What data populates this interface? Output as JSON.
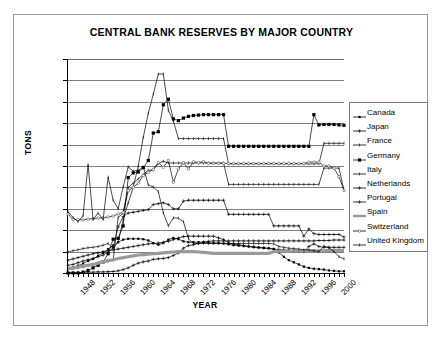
{
  "chart_data": {
    "type": "line",
    "title": "CENTRAL BANK RESERVES BY MAJOR COUNTRY",
    "xlabel": "YEAR",
    "ylabel": "TONS",
    "ylim": [
      0,
      5000
    ],
    "xlim": [
      1948,
      2003
    ],
    "grid": true,
    "legend_position": "right",
    "ytick_labels": [
      "5000",
      "4500",
      "4000",
      "3500",
      "3000",
      "2500",
      "2000",
      "1500",
      "1000",
      "500",
      "0"
    ],
    "ytick_values": [
      5000,
      4500,
      4000,
      3500,
      3000,
      2500,
      2000,
      1500,
      1000,
      500,
      0
    ],
    "xtick_labels": [
      "1948",
      "1952",
      "1956",
      "1960",
      "1964",
      "1968",
      "1972",
      "1976",
      "1980",
      "1984",
      "1988",
      "1992",
      "1996",
      "2000"
    ],
    "xtick_values": [
      1948,
      1952,
      1956,
      1960,
      1964,
      1968,
      1972,
      1976,
      1980,
      1984,
      1988,
      1992,
      1996,
      2000
    ],
    "x": [
      1948,
      1949,
      1950,
      1951,
      1952,
      1953,
      1954,
      1955,
      1956,
      1957,
      1958,
      1959,
      1960,
      1961,
      1962,
      1963,
      1964,
      1965,
      1966,
      1967,
      1968,
      1969,
      1970,
      1971,
      1972,
      1973,
      1974,
      1975,
      1976,
      1977,
      1978,
      1979,
      1980,
      1981,
      1982,
      1983,
      1984,
      1985,
      1986,
      1987,
      1988,
      1989,
      1990,
      1991,
      1992,
      1993,
      1994,
      1995,
      1996,
      1997,
      1998,
      1999,
      2000,
      2001,
      2002,
      2003
    ],
    "series": [
      {
        "name": "Canada",
        "marker": "small-square",
        "values": [
          100,
          130,
          170,
          220,
          280,
          330,
          400,
          470,
          560,
          640,
          720,
          780,
          800,
          800,
          800,
          790,
          760,
          700,
          660,
          700,
          780,
          820,
          790,
          740,
          720,
          720,
          720,
          720,
          710,
          700,
          700,
          690,
          670,
          650,
          640,
          630,
          620,
          610,
          600,
          590,
          580,
          560,
          480,
          380,
          300,
          250,
          200,
          150,
          120,
          100,
          90,
          80,
          60,
          50,
          40,
          40
        ]
      },
      {
        "name": "Japan",
        "marker": "plus",
        "values": [
          5,
          10,
          10,
          15,
          20,
          20,
          25,
          25,
          30,
          35,
          50,
          80,
          120,
          180,
          230,
          260,
          280,
          320,
          330,
          340,
          360,
          410,
          470,
          580,
          640,
          660,
          690,
          720,
          740,
          750,
          750,
          750,
          750,
          750,
          750,
          750,
          750,
          750,
          750,
          750,
          750,
          750,
          750,
          750,
          750,
          750,
          750,
          750,
          750,
          750,
          760,
          760,
          760,
          770,
          770,
          770
        ]
      },
      {
        "name": "France",
        "marker": "tick",
        "values": [
          490,
          520,
          540,
          570,
          590,
          600,
          620,
          650,
          690,
          580,
          720,
          1250,
          1640,
          2000,
          2500,
          3170,
          3730,
          4180,
          4650,
          4650,
          3800,
          3550,
          3140,
          3140,
          3140,
          3140,
          3140,
          3140,
          3140,
          3140,
          3140,
          3140,
          2550,
          2550,
          2550,
          2550,
          2550,
          2550,
          2550,
          2550,
          2550,
          2550,
          2550,
          2550,
          2550,
          2550,
          2550,
          2550,
          2550,
          2550,
          2550,
          3030,
          3030,
          3030,
          3030,
          3030
        ]
      },
      {
        "name": "Germany",
        "marker": "filled-square",
        "values": [
          0,
          0,
          0,
          20,
          60,
          120,
          180,
          260,
          450,
          790,
          810,
          1100,
          2230,
          2340,
          2360,
          2460,
          2630,
          3270,
          3300,
          3930,
          4060,
          3600,
          3560,
          3620,
          3660,
          3680,
          3690,
          3700,
          3700,
          3700,
          3700,
          3700,
          2960,
          2960,
          2960,
          2960,
          2960,
          2960,
          2960,
          2960,
          2960,
          2960,
          2960,
          2960,
          2960,
          2960,
          2960,
          2960,
          2960,
          3700,
          3460,
          3470,
          3470,
          3470,
          3460,
          3450
        ]
      },
      {
        "name": "Italy",
        "marker": "tick",
        "values": [
          80,
          100,
          120,
          140,
          170,
          200,
          230,
          250,
          280,
          300,
          1300,
          1400,
          2000,
          2100,
          2200,
          2300,
          2400,
          2410,
          2560,
          2610,
          2570,
          2570,
          2570,
          2570,
          2570,
          2570,
          2570,
          2570,
          2570,
          2570,
          2570,
          2570,
          2070,
          2070,
          2070,
          2070,
          2070,
          2070,
          2070,
          2070,
          2070,
          2070,
          2070,
          2070,
          2070,
          2070,
          2070,
          2070,
          2070,
          2070,
          2070,
          2450,
          2450,
          2450,
          2450,
          1930
        ]
      },
      {
        "name": "Netherlands",
        "marker": "plus",
        "values": [
          180,
          200,
          240,
          280,
          310,
          340,
          380,
          420,
          490,
          590,
          1080,
          1320,
          1400,
          1420,
          1440,
          1460,
          1480,
          1600,
          1620,
          1640,
          1600,
          1500,
          1500,
          1680,
          1700,
          1700,
          1700,
          1700,
          1700,
          1700,
          1700,
          1700,
          1370,
          1370,
          1370,
          1370,
          1370,
          1370,
          1370,
          1370,
          1370,
          1100,
          1100,
          1100,
          1100,
          1100,
          1100,
          860,
          1030,
          920,
          900,
          900,
          900,
          900,
          900,
          840
        ]
      },
      {
        "name": "Portugal",
        "marker": "plus",
        "values": [
          300,
          330,
          360,
          390,
          420,
          450,
          470,
          500,
          520,
          540,
          560,
          580,
          600,
          620,
          640,
          660,
          680,
          690,
          700,
          720,
          740,
          780,
          820,
          850,
          860,
          860,
          860,
          860,
          860,
          860,
          820,
          780,
          700,
          680,
          660,
          640,
          620,
          600,
          590,
          580,
          570,
          560,
          550,
          540,
          530,
          520,
          510,
          500,
          620,
          680,
          620,
          600,
          600,
          600,
          600,
          600
        ]
      },
      {
        "name": "Spain",
        "marker": "none",
        "values": [
          100,
          120,
          140,
          160,
          180,
          200,
          230,
          260,
          290,
          310,
          340,
          360,
          380,
          400,
          420,
          430,
          440,
          450,
          460,
          470,
          480,
          490,
          500,
          500,
          500,
          500,
          490,
          480,
          470,
          460,
          460,
          460,
          460,
          460,
          460,
          460,
          460,
          460,
          460,
          460,
          460,
          500,
          510,
          510,
          510,
          520,
          520,
          520,
          520,
          520,
          520,
          520,
          530,
          530,
          530,
          530
        ]
      },
      {
        "name": "Switzerland",
        "marker": "open-circle",
        "values": [
          1380,
          1250,
          1250,
          1240,
          1260,
          1270,
          1280,
          1290,
          1310,
          1330,
          1380,
          1420,
          1920,
          2000,
          2100,
          2280,
          2350,
          2420,
          2580,
          2470,
          2630,
          2120,
          2430,
          2580,
          2430,
          2600,
          2580,
          2600,
          2560,
          2560,
          2560,
          2560,
          2560,
          2560,
          2560,
          2560,
          2560,
          2560,
          2560,
          2560,
          2560,
          2560,
          2560,
          2560,
          2560,
          2560,
          2560,
          2560,
          2590,
          2590,
          2590,
          2500,
          2500,
          2450,
          2250,
          1930
        ]
      },
      {
        "name": "United Kingdom",
        "marker": "tick",
        "values": [
          1430,
          1300,
          1200,
          1340,
          2530,
          1250,
          1400,
          1250,
          2240,
          1700,
          1500,
          2010,
          2480,
          2380,
          2400,
          2480,
          2060,
          2010,
          1900,
          1400,
          1100,
          1290,
          1280,
          1200,
          800,
          690,
          690,
          690,
          690,
          690,
          690,
          690,
          690,
          690,
          690,
          690,
          690,
          690,
          690,
          690,
          690,
          680,
          620,
          600,
          580,
          570,
          560,
          540,
          540,
          520,
          500,
          630,
          590,
          500,
          380,
          330
        ]
      }
    ]
  },
  "legend": {
    "items": [
      {
        "label": "Canada",
        "symbol": "small-square"
      },
      {
        "label": "Japan",
        "symbol": "plus"
      },
      {
        "label": "France",
        "symbol": "tick"
      },
      {
        "label": "Germany",
        "symbol": "filled-square"
      },
      {
        "label": "Italy",
        "symbol": "tick"
      },
      {
        "label": "Netherlands",
        "symbol": "plus"
      },
      {
        "label": "Portugal",
        "symbol": "plus"
      },
      {
        "label": "Spain",
        "symbol": "none"
      },
      {
        "label": "Switzerland",
        "symbol": "open-circle"
      },
      {
        "label": "United Kingdom",
        "symbol": "tick"
      }
    ]
  },
  "colors": {
    "ink": "#000000",
    "grid": "#808080",
    "frame": "#9a9a9a",
    "legend_border": "#7d7d7d",
    "background": "#ffffff"
  }
}
